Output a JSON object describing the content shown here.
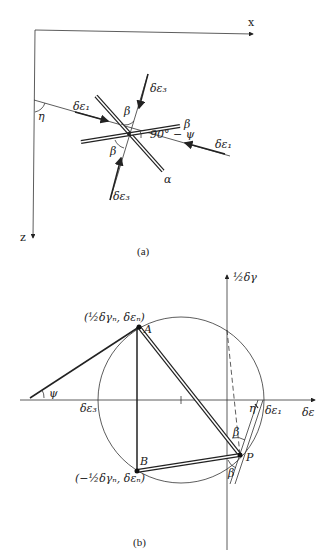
{
  "header": {
    "running_head": ""
  },
  "figure_a": {
    "caption": "(a)",
    "axes": {
      "x_label": "x",
      "z_label": "z"
    },
    "labels": {
      "eta": "η",
      "de1_left": "δε₁",
      "de1_right": "δε₁",
      "de3_top": "δε₃",
      "de3_bottom": "δε₃",
      "beta_top": "β",
      "beta_right": "β",
      "beta_left": "β",
      "angle": "90° − ψ",
      "alpha": "α"
    }
  },
  "figure_b": {
    "caption": "(b)",
    "axes": {
      "x_label": "δε",
      "y_label": "½δγ"
    },
    "labels": {
      "point_a": "A",
      "point_b": "B",
      "point_p": "P",
      "coord_a": "(½δγₙ, δεₙ)",
      "coord_b": "(−½δγₙ, δεₙ)",
      "psi": "ψ",
      "eta": "η",
      "de1": "δε₁",
      "de3": "δε₃",
      "beta_1": "β",
      "beta_2": "β"
    }
  }
}
